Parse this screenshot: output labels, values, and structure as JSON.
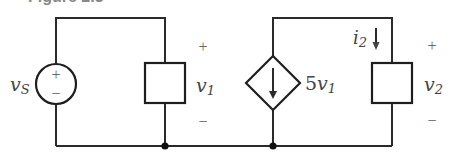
{
  "figure": {
    "title_clipped": "Figure 2.3"
  },
  "circuit": {
    "source": {
      "name": "v",
      "subscript": "S",
      "plus": "+",
      "minus": "−"
    },
    "element1": {
      "voltage_name": "v",
      "voltage_subscript": "1",
      "plus": "+",
      "minus": "−"
    },
    "dependent_source": {
      "coefficient": "5",
      "control_var": "v",
      "control_subscript": "1"
    },
    "element2": {
      "current_name": "i",
      "current_subscript": "2",
      "voltage_name": "v",
      "voltage_subscript": "2",
      "plus": "+",
      "minus": "−"
    }
  },
  "colors": {
    "wire": "#2a2a2a",
    "label": "#444444",
    "background": "#ffffff"
  }
}
